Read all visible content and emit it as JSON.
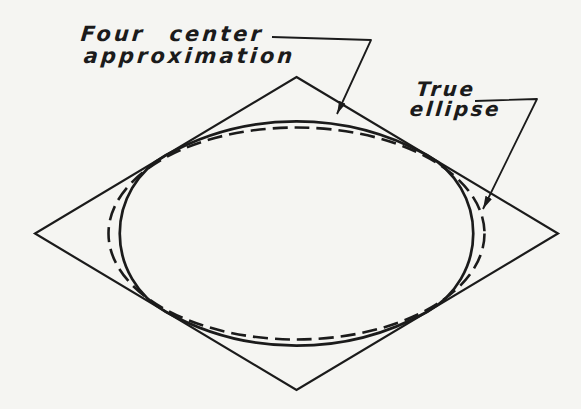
{
  "figure": {
    "labels": {
      "four_center": {
        "line1": "Four center",
        "line2": "approximation"
      },
      "true_ellipse": {
        "line1": "True",
        "line2": "ellipse"
      }
    },
    "colors": {
      "ink": "#1b1b1b",
      "paper": "#f5f5f2"
    }
  }
}
